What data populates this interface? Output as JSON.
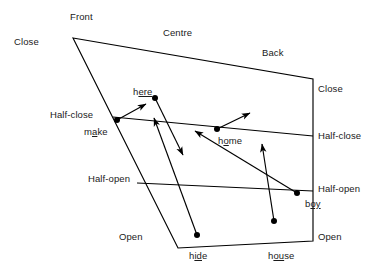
{
  "figure": {
    "type": "spatial-deixis-diagram",
    "background_color": "#ffffff",
    "line_color": "#000000",
    "text_color": "#1a1a1a"
  },
  "axis_labels": {
    "top": [
      {
        "text": "Front",
        "x": 70,
        "y": 12
      },
      {
        "text": "Centre",
        "x": 163,
        "y": 28
      },
      {
        "text": "Back",
        "x": 262,
        "y": 48
      }
    ],
    "left": [
      {
        "text": "Close",
        "x": 14,
        "y": 37
      },
      {
        "text": "Half-close",
        "x": 50,
        "y": 110
      },
      {
        "text": "Half-open",
        "x": 88,
        "y": 174
      },
      {
        "text": "Open",
        "x": 119,
        "y": 232
      }
    ],
    "right": [
      {
        "text": "Close",
        "x": 318,
        "y": 84
      },
      {
        "text": "Half-close",
        "x": 318,
        "y": 131
      },
      {
        "text": "Half-open",
        "x": 318,
        "y": 184
      },
      {
        "text": "Open",
        "x": 318,
        "y": 232
      }
    ]
  },
  "word_labels": [
    {
      "text": "here",
      "plain_prefix": "h",
      "underlined": "ere",
      "plain_suffix": "",
      "x": 133,
      "y": 87
    },
    {
      "text": "make",
      "plain_prefix": "m",
      "underlined": "a",
      "plain_suffix": "ke",
      "x": 84,
      "y": 127
    },
    {
      "text": "home",
      "plain_prefix": "h",
      "underlined": "o",
      "plain_suffix": "me",
      "x": 218,
      "y": 136
    },
    {
      "text": "boy",
      "plain_prefix": "b",
      "underlined": "oy",
      "plain_suffix": "",
      "x": 305,
      "y": 199
    },
    {
      "text": "hide",
      "plain_prefix": "h",
      "underlined": "id",
      "plain_suffix": "e",
      "x": 189,
      "y": 251
    },
    {
      "text": "house",
      "plain_prefix": "h",
      "underlined": "ou",
      "plain_suffix": "se",
      "x": 268,
      "y": 251
    }
  ],
  "frame_outline": {
    "description": "vowel quadrilateral: apex top-left, slanted left edge, vertical right edge",
    "points": "73,38 313,79 313,241 178,248"
  },
  "level_lines": [
    {
      "name": "half-close-line",
      "x1": 113,
      "y1": 117,
      "x2": 313,
      "y2": 136
    },
    {
      "name": "half-open-line",
      "x1": 137,
      "y1": 183,
      "x2": 313,
      "y2": 191
    }
  ],
  "vowel_points": [
    {
      "name": "here",
      "cx": 155,
      "cy": 98
    },
    {
      "name": "make",
      "cx": 117,
      "cy": 120
    },
    {
      "name": "home",
      "cx": 217,
      "cy": 129
    },
    {
      "name": "boy",
      "cx": 297,
      "cy": 193
    },
    {
      "name": "hide",
      "cx": 197,
      "cy": 235
    },
    {
      "name": "house",
      "cx": 274,
      "cy": 221
    }
  ],
  "trajectory_arrows": [
    {
      "name": "make-arrow",
      "x1": 117,
      "y1": 120,
      "x2": 146,
      "y2": 104
    },
    {
      "name": "here-arrow",
      "x1": 155,
      "y1": 98,
      "x2": 183,
      "y2": 155
    },
    {
      "name": "home-arrow",
      "x1": 217,
      "y1": 129,
      "x2": 250,
      "y2": 113
    },
    {
      "name": "hide-arrow",
      "x1": 197,
      "y1": 235,
      "x2": 154,
      "y2": 118
    },
    {
      "name": "house-arrow",
      "x1": 274,
      "y1": 221,
      "x2": 262,
      "y2": 144
    },
    {
      "name": "boy-arrow",
      "x1": 297,
      "y1": 193,
      "x2": 195,
      "y2": 131
    }
  ]
}
